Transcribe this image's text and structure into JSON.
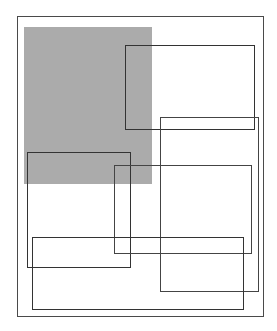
{
  "diagram": {
    "background": "#ffffff",
    "frame": {
      "x": 17,
      "y": 16,
      "w": 247,
      "h": 301,
      "stroke": "#4a4a4a",
      "stroke_width": 1
    },
    "shaded_region": {
      "x": 24,
      "y": 27,
      "w": 128,
      "h": 157,
      "fill": "#ababab"
    },
    "rectangles": [
      {
        "id": "rect-a",
        "x": 125,
        "y": 45,
        "w": 130,
        "h": 85,
        "stroke": "#333333"
      },
      {
        "id": "rect-b",
        "x": 160,
        "y": 117,
        "w": 99,
        "h": 175,
        "stroke": "#444444"
      },
      {
        "id": "rect-c",
        "x": 27,
        "y": 152,
        "w": 104,
        "h": 116,
        "stroke": "#333333"
      },
      {
        "id": "rect-d",
        "x": 114,
        "y": 165,
        "w": 138,
        "h": 89,
        "stroke": "#444444"
      },
      {
        "id": "rect-e",
        "x": 32,
        "y": 237,
        "w": 212,
        "h": 73,
        "stroke": "#333333"
      }
    ]
  }
}
